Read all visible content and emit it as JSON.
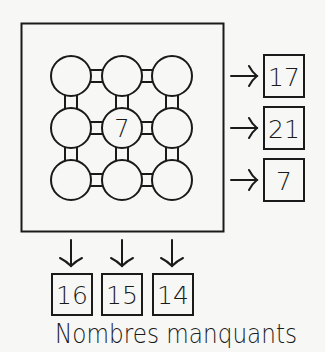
{
  "puzzle": {
    "caption": "Nombres manquants",
    "grid": [
      [
        "",
        "",
        ""
      ],
      [
        "",
        "7",
        ""
      ],
      [
        "",
        "",
        ""
      ]
    ],
    "row_sums": [
      "17",
      "21",
      "7"
    ],
    "column_sums": [
      "16",
      "15",
      "14"
    ]
  },
  "colors": {
    "background": "#f7f7f5",
    "stroke": "#1a1a1a"
  }
}
